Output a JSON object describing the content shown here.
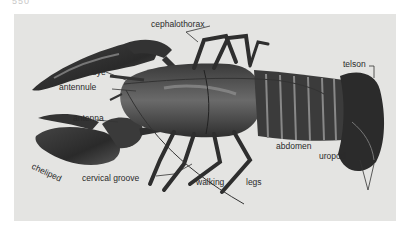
{
  "page": {
    "number": "550"
  },
  "figure": {
    "labels": {
      "cephalothorax": "cephalothorax",
      "eye": "eye",
      "antennule": "antennule",
      "antenna": "antenna",
      "cheliped": "cheliped",
      "cervical_groove": "cervical groove",
      "walking": "walking",
      "legs": "legs",
      "abdomen": "abdomen",
      "telson": "telson",
      "uropod": "uropod"
    },
    "colors": {
      "background": "#e4e4e2",
      "body_dark": "#2b2b2b",
      "body_mid": "#555555",
      "label": "#2a2a2a"
    }
  }
}
